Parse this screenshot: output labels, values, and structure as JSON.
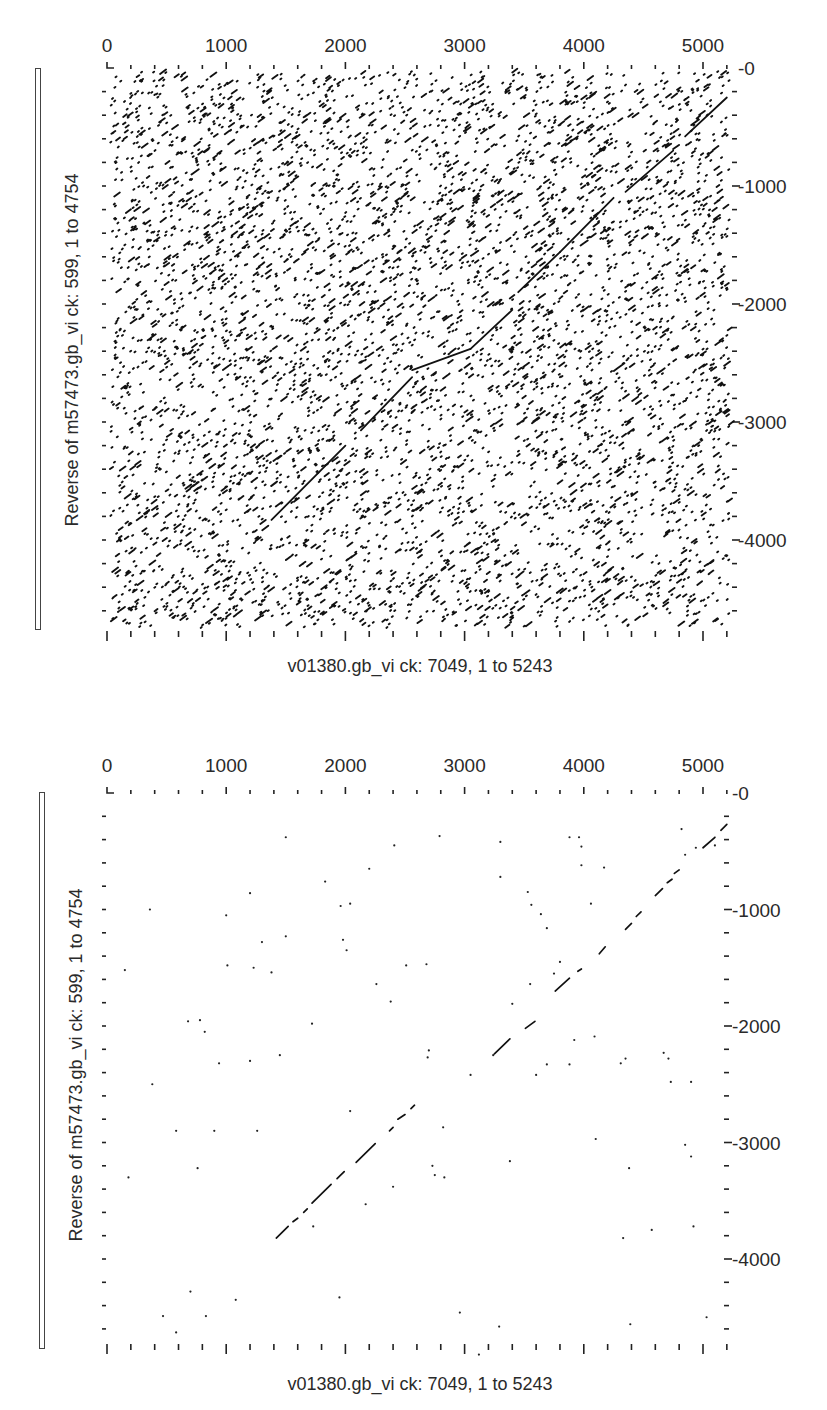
{
  "charts": [
    {
      "id": "dotplot-unfiltered",
      "xlabel": "v01380.gb_vi ck: 7049, 1 to 5243",
      "ylabel": "Reverse of m57473.gb_vi ck: 599, 1 to 4754",
      "x_ticks": [
        "0",
        "1000",
        "2000",
        "3000",
        "4000",
        "5000"
      ],
      "y_ticks": [
        "0",
        "1000",
        "2000",
        "3000",
        "4000"
      ]
    },
    {
      "id": "dotplot-filtered",
      "xlabel": "v01380.gb_vi ck: 7049, 1 to 5243",
      "ylabel": "Reverse of m57473.gb_vi ck: 599, 1 to 4754",
      "x_ticks": [
        "0",
        "1000",
        "2000",
        "3000",
        "4000",
        "5000"
      ],
      "y_ticks": [
        "0",
        "1000",
        "2000",
        "3000",
        "4000"
      ]
    }
  ],
  "chart_data": [
    {
      "type": "scatter",
      "title": "",
      "subtitle": "Dot plot (low stringency / dense noise)",
      "xlabel": "v01380.gb_vi ck: 7049, 1 to 5243",
      "ylabel": "Reverse of m57473.gb_vi ck: 599, 1 to 4754",
      "xlim": [
        0,
        5243
      ],
      "ylim": [
        4754,
        0
      ],
      "x_axis_position": "top",
      "y_axis_position": "right",
      "x_tick_labels": [
        0,
        1000,
        2000,
        3000,
        4000,
        5000
      ],
      "y_tick_labels": [
        0,
        1000,
        2000,
        3000,
        4000
      ],
      "minor_tick_step": 200,
      "grid": false,
      "legend": null,
      "background_noise": {
        "description": "thousands of scattered short match dots across entire plot",
        "approx_density": "high",
        "seed": 7049
      },
      "diagonal_segments": [
        {
          "x": [
            1380,
            2000
          ],
          "y": [
            3830,
            3200
          ]
        },
        {
          "x": [
            2130,
            2560
          ],
          "y": [
            3070,
            2620
          ]
        },
        {
          "x": [
            2560,
            3050
          ],
          "y": [
            2560,
            2380
          ]
        },
        {
          "x": [
            3050,
            3400
          ],
          "y": [
            2380,
            2050
          ]
        },
        {
          "x": [
            3450,
            3800
          ],
          "y": [
            1900,
            1560
          ]
        },
        {
          "x": [
            3800,
            4250
          ],
          "y": [
            1560,
            1100
          ]
        },
        {
          "x": [
            4350,
            4750
          ],
          "y": [
            1050,
            700
          ]
        },
        {
          "x": [
            4850,
            5200
          ],
          "y": [
            580,
            250
          ]
        }
      ]
    },
    {
      "type": "scatter",
      "title": "",
      "subtitle": "Dot plot (high stringency / filtered)",
      "xlabel": "v01380.gb_vi ck: 7049, 1 to 5243",
      "ylabel": "Reverse of m57473.gb_vi ck: 599, 1 to 4754",
      "xlim": [
        0,
        5243
      ],
      "ylim": [
        4754,
        0
      ],
      "x_axis_position": "top",
      "y_axis_position": "right",
      "x_tick_labels": [
        0,
        1000,
        2000,
        3000,
        4000,
        5000
      ],
      "y_tick_labels": [
        0,
        1000,
        2000,
        3000,
        4000
      ],
      "minor_tick_step": 200,
      "grid": false,
      "legend": null,
      "diagonal_segments": [
        {
          "x": [
            1420,
            1520
          ],
          "y": [
            3820,
            3720
          ]
        },
        {
          "x": [
            1560,
            1600
          ],
          "y": [
            3680,
            3650
          ]
        },
        {
          "x": [
            1650,
            1680
          ],
          "y": [
            3600,
            3570
          ]
        },
        {
          "x": [
            1720,
            1880
          ],
          "y": [
            3520,
            3360
          ]
        },
        {
          "x": [
            1930,
            1990
          ],
          "y": [
            3310,
            3250
          ]
        },
        {
          "x": [
            2090,
            2250
          ],
          "y": [
            3170,
            3010
          ]
        },
        {
          "x": [
            2370,
            2400
          ],
          "y": [
            2900,
            2870
          ]
        },
        {
          "x": [
            2440,
            2500
          ],
          "y": [
            2800,
            2760
          ]
        },
        {
          "x": [
            2550,
            2580
          ],
          "y": [
            2710,
            2680
          ]
        },
        {
          "x": [
            3250,
            3380
          ],
          "y": [
            2240,
            2110
          ]
        },
        {
          "x": [
            3510,
            3590
          ],
          "y": [
            2020,
            1960
          ]
        },
        {
          "x": [
            3760,
            3880
          ],
          "y": [
            1700,
            1590
          ]
        },
        {
          "x": [
            3950,
            3980
          ],
          "y": [
            1530,
            1510
          ]
        },
        {
          "x": [
            4130,
            4180
          ],
          "y": [
            1380,
            1320
          ]
        },
        {
          "x": [
            4350,
            4400
          ],
          "y": [
            1170,
            1120
          ]
        },
        {
          "x": [
            4440,
            4480
          ],
          "y": [
            1060,
            1020
          ]
        },
        {
          "x": [
            4600,
            4660
          ],
          "y": [
            880,
            820
          ]
        },
        {
          "x": [
            4700,
            4740
          ],
          "y": [
            770,
            740
          ]
        },
        {
          "x": [
            4760,
            4800
          ],
          "y": [
            690,
            660
          ]
        },
        {
          "x": [
            5000,
            5100
          ],
          "y": [
            470,
            380
          ]
        },
        {
          "x": [
            5150,
            5200
          ],
          "y": [
            320,
            270
          ]
        }
      ],
      "isolated_points": [
        [
          1000,
          1050
        ],
        [
          360,
          1000
        ],
        [
          680,
          1960
        ],
        [
          780,
          1950
        ],
        [
          820,
          2050
        ],
        [
          940,
          2320
        ],
        [
          1200,
          2300
        ],
        [
          1450,
          2250
        ],
        [
          1260,
          2900
        ],
        [
          580,
          2900
        ],
        [
          760,
          3220
        ],
        [
          900,
          2900
        ],
        [
          180,
          3300
        ],
        [
          380,
          2500
        ],
        [
          150,
          1520
        ],
        [
          1010,
          1480
        ],
        [
          1230,
          1500
        ],
        [
          1200,
          860
        ],
        [
          1300,
          1280
        ],
        [
          1500,
          1230
        ],
        [
          1980,
          1260
        ],
        [
          2010,
          1350
        ],
        [
          2040,
          2730
        ],
        [
          2260,
          1640
        ],
        [
          2380,
          1790
        ],
        [
          2510,
          1480
        ],
        [
          2680,
          1470
        ],
        [
          2690,
          2270
        ],
        [
          2700,
          2210
        ],
        [
          2820,
          2870
        ],
        [
          3050,
          2420
        ],
        [
          3240,
          2250
        ],
        [
          3380,
          3160
        ],
        [
          3600,
          2420
        ],
        [
          3690,
          2330
        ],
        [
          3880,
          2330
        ],
        [
          3920,
          2120
        ],
        [
          4090,
          2090
        ],
        [
          4310,
          2320
        ],
        [
          4350,
          2280
        ],
        [
          4670,
          2230
        ],
        [
          4710,
          2280
        ],
        [
          4730,
          2480
        ],
        [
          4900,
          2480
        ],
        [
          4100,
          2970
        ],
        [
          4380,
          3220
        ],
        [
          4850,
          3020
        ],
        [
          4900,
          3120
        ],
        [
          2400,
          3380
        ],
        [
          2750,
          3280
        ],
        [
          2830,
          3300
        ],
        [
          2170,
          3530
        ],
        [
          4330,
          3820
        ],
        [
          4570,
          3750
        ],
        [
          4920,
          3720
        ],
        [
          470,
          4490
        ],
        [
          580,
          4630
        ],
        [
          830,
          4490
        ],
        [
          1080,
          4350
        ],
        [
          700,
          4280
        ],
        [
          2730,
          3200
        ],
        [
          1730,
          3720
        ],
        [
          1500,
          380
        ],
        [
          1720,
          1980
        ],
        [
          3880,
          380
        ],
        [
          3960,
          380
        ],
        [
          3980,
          460
        ],
        [
          3980,
          620
        ],
        [
          4820,
          310
        ],
        [
          4850,
          530
        ],
        [
          4940,
          470
        ],
        [
          5100,
          450
        ],
        [
          3300,
          420
        ],
        [
          4170,
          640
        ],
        [
          3300,
          720
        ],
        [
          3530,
          850
        ],
        [
          3560,
          960
        ],
        [
          3640,
          1040
        ],
        [
          3690,
          1160
        ],
        [
          4060,
          950
        ],
        [
          2790,
          370
        ],
        [
          2200,
          650
        ],
        [
          2410,
          450
        ],
        [
          1830,
          760
        ],
        [
          2040,
          950
        ],
        [
          1960,
          970
        ],
        [
          1380,
          1540
        ],
        [
          3550,
          1640
        ],
        [
          3400,
          1810
        ],
        [
          3750,
          1550
        ],
        [
          3800,
          1450
        ],
        [
          1950,
          4330
        ],
        [
          2960,
          4460
        ],
        [
          3290,
          4580
        ],
        [
          4390,
          4560
        ],
        [
          5030,
          4500
        ],
        [
          3120,
          4820
        ]
      ]
    }
  ]
}
